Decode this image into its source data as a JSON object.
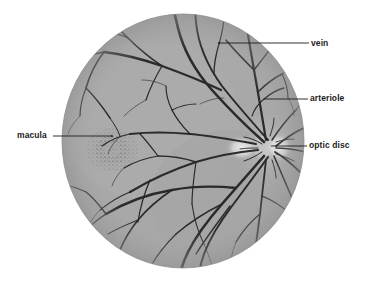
{
  "figure": {
    "background_color": "#ffffff",
    "retina_fill_color": "#a9a9a9",
    "vessel_color": "#2a2a2a",
    "leader_color": "#1c1c1c",
    "circle": {
      "cx": 183,
      "cy": 141,
      "rx": 121,
      "ry": 127
    }
  },
  "labels": [
    {
      "id": "vein",
      "text": "vein",
      "text_x": 311,
      "text_y": 38,
      "leader": {
        "x1": 309,
        "y1": 43,
        "x2": 219,
        "y2": 43
      }
    },
    {
      "id": "arteriole",
      "text": "arteriole",
      "text_x": 310,
      "text_y": 93,
      "leader": {
        "x1": 308,
        "y1": 99,
        "x2": 264,
        "y2": 99
      }
    },
    {
      "id": "optic-disc",
      "text": "optic disc",
      "text_x": 309,
      "text_y": 140,
      "leader": {
        "x1": 307,
        "y1": 146,
        "x2": 271,
        "y2": 146
      }
    },
    {
      "id": "macula",
      "text": "macula",
      "text_x": 17,
      "text_y": 130,
      "leader": {
        "x1": 53,
        "y1": 136,
        "x2": 112,
        "y2": 136
      }
    }
  ],
  "features": {
    "optic_disc": {
      "cx": 268,
      "cy": 148,
      "label": "optic disc bright region"
    },
    "macula": {
      "cx": 112,
      "cy": 150,
      "label": "macula stippled region"
    }
  }
}
